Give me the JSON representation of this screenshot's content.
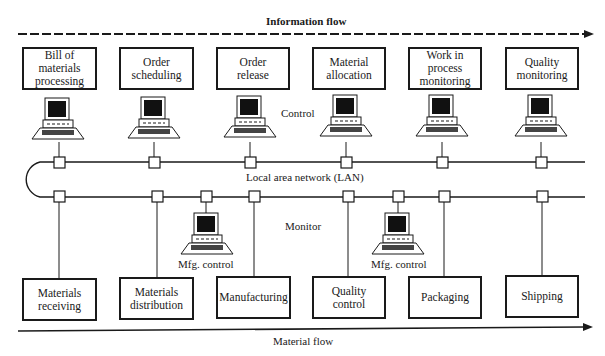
{
  "title_information_flow": "Information flow",
  "title_material_flow": "Material flow",
  "label_control": "Control",
  "label_lan": "Local area network (LAN)",
  "label_monitor": "Monitor",
  "top_boxes": [
    {
      "label": "Bill of\nmaterials\nprocessing"
    },
    {
      "label": "Order\nscheduling"
    },
    {
      "label": "Order\nrelease"
    },
    {
      "label": "Material\nallocation"
    },
    {
      "label": "Work in\nprocess\nmonitoring"
    },
    {
      "label": "Quality\nmonitoring"
    }
  ],
  "bottom_boxes": [
    {
      "label": "Materials\nreceiving"
    },
    {
      "label": "Materials\ndistribution"
    },
    {
      "label": "Manufacturing"
    },
    {
      "label": "Quality\ncontrol"
    },
    {
      "label": "Packaging"
    },
    {
      "label": "Shipping"
    }
  ],
  "mfg_control_labels": [
    "Mfg. control",
    "Mfg. control"
  ]
}
